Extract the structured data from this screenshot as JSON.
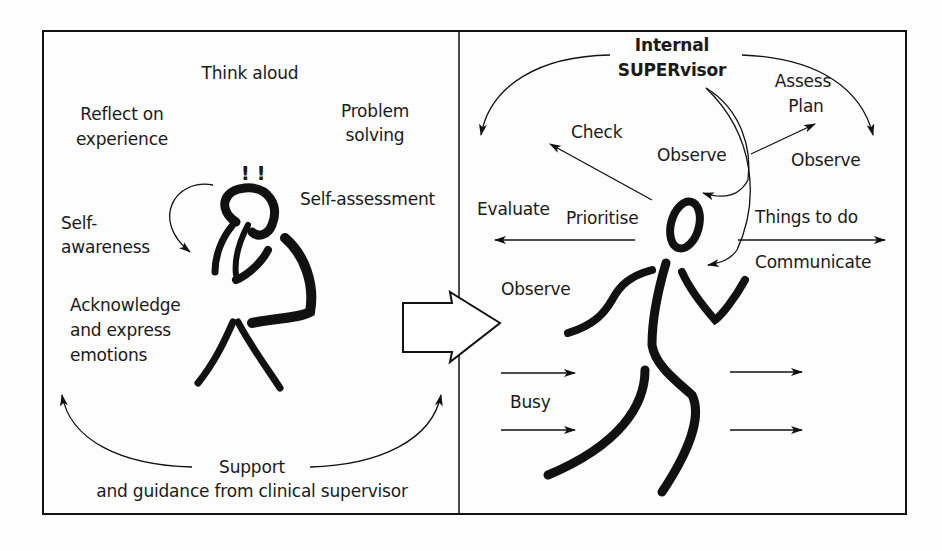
{
  "left_panel": {
    "name": "Reflective learning",
    "labels": {
      "think_aloud": "Think aloud",
      "reflect_1": "Reflect on",
      "reflect_2": "experience",
      "problem_1": "Problem",
      "problem_2": "solving",
      "exclaim": "! !",
      "self_assessment": "Self-assessment",
      "self_awareness_1": "Self-",
      "self_awareness_2": "awareness",
      "acknowledge_1": "Acknowledge",
      "acknowledge_2": "and express",
      "acknowledge_3": "emotions",
      "support_1": "Support",
      "support_2": "and guidance from clinical supervisor"
    }
  },
  "right_panel": {
    "name": "Internal supervisor in action",
    "labels": {
      "internal_1": "Internal",
      "internal_2": "SUPERvisor",
      "assess": "Assess",
      "plan": "Plan",
      "check": "Check",
      "observe_center": "Observe",
      "observe_right": "Observe",
      "observe_left": "Observe",
      "evaluate": "Evaluate",
      "prioritise": "Prioritise",
      "things_to_do": "Things to do",
      "communicate": "Communicate",
      "busy": "Busy"
    }
  },
  "colors": {
    "ink": "#111111",
    "background": "#fdfdfd"
  }
}
